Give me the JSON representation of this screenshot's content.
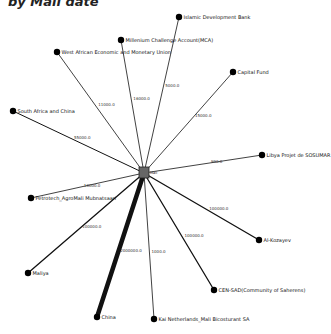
{
  "title_fragment": "by Mali date",
  "center": {
    "id": "mali",
    "label": "Mali",
    "color": "#666666"
  },
  "colors": {
    "edge": "#111111",
    "node": "#000000",
    "center_node": "#666666"
  },
  "nodes": [
    {
      "id": "islamic-development-bank",
      "label": "Islamic Development Bank",
      "weight": 5000.0,
      "weight_label": "5000.0",
      "x": 179,
      "y": 17
    },
    {
      "id": "millennium-challenge-account",
      "label": "Millenium Challenge Account(MCA)",
      "weight": 16000.0,
      "weight_label": "16000.0",
      "x": 121,
      "y": 40
    },
    {
      "id": "west-african-economic-monetary-union",
      "label": "West African Economic and Monetary Union",
      "weight": 11000.0,
      "weight_label": "11000.0",
      "x": 57,
      "y": 52
    },
    {
      "id": "capital-fund",
      "label": "Capital Fund",
      "weight": 15000.0,
      "weight_label": "15000.0",
      "x": 233,
      "y": 72
    },
    {
      "id": "south-africa-and-china",
      "label": "South Africa and China",
      "weight": 55000.0,
      "weight_label": "55000.0",
      "x": 13,
      "y": 111
    },
    {
      "id": "libya-projet-sosumar",
      "label": "Libya Projet de SOSUMAR",
      "weight": 990.0,
      "weight_label": "990.0",
      "x": 262,
      "y": 155
    },
    {
      "id": "petrotech-agromali",
      "label": "Petrotech_AgroMali Mubnatsaari",
      "weight": 10000.0,
      "weight_label": "10000.0",
      "x": 31,
      "y": 198
    },
    {
      "id": "al-kozayev",
      "label": "Al-Kozayev",
      "weight": 100000.0,
      "weight_label": "100000.0",
      "x": 259,
      "y": 240
    },
    {
      "id": "maliya",
      "label": "Maliya",
      "weight": 100000.0,
      "weight_label": "100000.0",
      "x": 28,
      "y": 273
    },
    {
      "id": "cen-sad",
      "label": "CEN-SAD(Community of Saherens)",
      "weight": 100000.0,
      "weight_label": "100000.0",
      "x": 214,
      "y": 290
    },
    {
      "id": "china",
      "label": "China",
      "weight": 2000000.0,
      "weight_label": "2000000.0",
      "x": 97,
      "y": 317
    },
    {
      "id": "kai-netherlands-mali",
      "label": "Kai Netherlands_Mali Bicosturant SA",
      "weight": 1000.0,
      "weight_label": "1000.0",
      "x": 154,
      "y": 319
    }
  ]
}
